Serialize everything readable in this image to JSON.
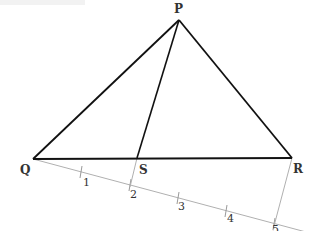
{
  "diagram": {
    "type": "geometry-construction",
    "points": {
      "P": {
        "label": "P",
        "x": 179,
        "y": 20
      },
      "Q": {
        "label": "Q",
        "x": 33,
        "y": 159
      },
      "R": {
        "label": "R",
        "x": 292,
        "y": 158
      },
      "S": {
        "label": "S",
        "x": 137,
        "y": 158
      }
    },
    "ray_marks": [
      {
        "label": "1",
        "x": 81,
        "y": 172
      },
      {
        "label": "2",
        "x": 130,
        "y": 185
      },
      {
        "label": "3",
        "x": 178,
        "y": 198
      },
      {
        "label": "4",
        "x": 226,
        "y": 211
      },
      {
        "label": "5",
        "x": 274,
        "y": 224
      }
    ],
    "segments": [
      "PQ",
      "PR",
      "QR",
      "PS"
    ],
    "construction_lines": [
      "Q-ray",
      "R-5",
      "S-2"
    ],
    "colors": {
      "triangle": "#111111",
      "construction": "#aaaaaa",
      "labels": "#333333"
    }
  }
}
